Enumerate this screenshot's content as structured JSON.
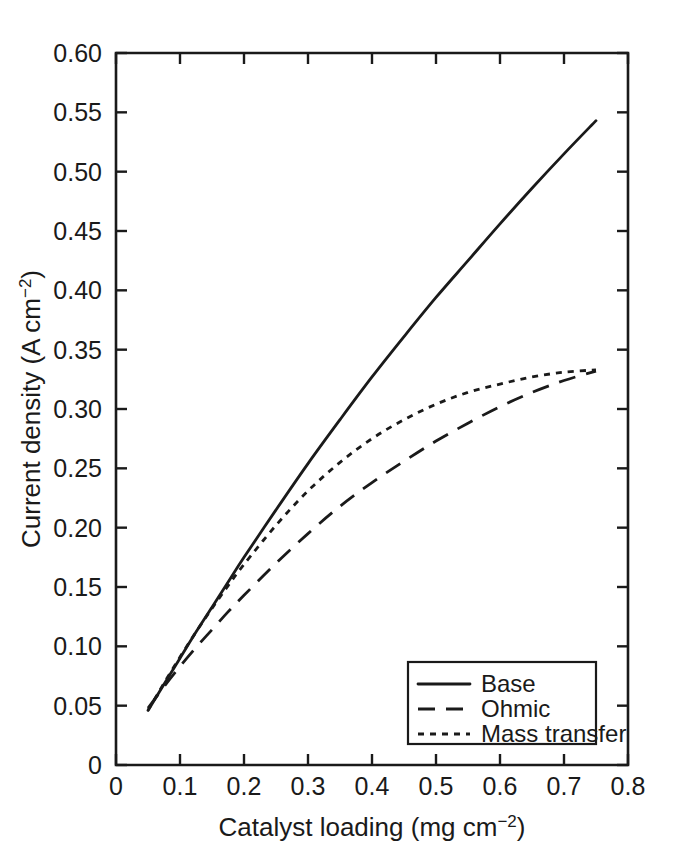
{
  "chart_data": {
    "type": "line",
    "title": "",
    "xlabel": "Catalyst loading (mg cm−2)",
    "xlabel_base": "Catalyst loading (mg cm",
    "xlabel_sup": "−2",
    "xlabel_tail": ")",
    "ylabel": "Current density (A cm−2)",
    "ylabel_base": "Current density (A cm",
    "ylabel_sup": "−2",
    "ylabel_tail": ")",
    "xlim": [
      0,
      0.8
    ],
    "ylim": [
      0,
      0.6
    ],
    "grid": false,
    "legend_position": "lower right",
    "xticks": [
      0,
      0.1,
      0.2,
      0.3,
      0.4,
      0.5,
      0.6,
      0.7,
      0.8
    ],
    "xtick_labels": [
      "0",
      "0.1",
      "0.2",
      "0.3",
      "0.4",
      "0.5",
      "0.6",
      "0.7",
      "0.8"
    ],
    "yticks": [
      0,
      0.05,
      0.1,
      0.15,
      0.2,
      0.25,
      0.3,
      0.35,
      0.4,
      0.45,
      0.5,
      0.55,
      0.6
    ],
    "ytick_labels": [
      "0",
      "0.05",
      "0.10",
      "0.15",
      "0.20",
      "0.25",
      "0.30",
      "0.35",
      "0.40",
      "0.45",
      "0.50",
      "0.55",
      "0.60"
    ],
    "x": [
      0.05,
      0.075,
      0.1,
      0.125,
      0.15,
      0.175,
      0.2,
      0.25,
      0.3,
      0.35,
      0.4,
      0.45,
      0.5,
      0.55,
      0.6,
      0.65,
      0.7,
      0.75
    ],
    "series": [
      {
        "name": "Base",
        "style": "solid",
        "color": "#1a1a1a",
        "values": [
          0.046,
          0.068,
          0.09,
          0.112,
          0.133,
          0.154,
          0.175,
          0.215,
          0.254,
          0.291,
          0.327,
          0.361,
          0.394,
          0.425,
          0.456,
          0.486,
          0.515,
          0.543
        ]
      },
      {
        "name": "Ohmic",
        "style": "dashed",
        "color": "#1a1a1a",
        "values": [
          0.048,
          0.066,
          0.083,
          0.099,
          0.114,
          0.129,
          0.143,
          0.17,
          0.195,
          0.218,
          0.238,
          0.256,
          0.273,
          0.288,
          0.302,
          0.314,
          0.324,
          0.332
        ]
      },
      {
        "name": "Mass transfer",
        "style": "dotted",
        "color": "#1a1a1a",
        "values": [
          0.046,
          0.069,
          0.091,
          0.112,
          0.132,
          0.151,
          0.169,
          0.202,
          0.231,
          0.255,
          0.275,
          0.291,
          0.304,
          0.314,
          0.321,
          0.327,
          0.331,
          0.333
        ]
      }
    ],
    "legend_entries": [
      {
        "label": "Base",
        "style": "solid"
      },
      {
        "label": "Ohmic",
        "style": "dashed"
      },
      {
        "label": "Mass transfer",
        "style": "dotted"
      }
    ]
  }
}
